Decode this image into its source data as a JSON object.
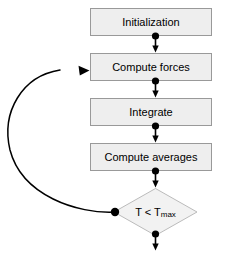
{
  "diagram": {
    "type": "flowchart",
    "canvas": {
      "width": 228,
      "height": 254
    },
    "colors": {
      "node_fill": "#eeeeee",
      "node_stroke": "#999999",
      "connector": "#000000",
      "background": "#ffffff",
      "text": "#000000"
    },
    "nodes": [
      {
        "id": "initialization",
        "shape": "rectangle",
        "label": "Initialization",
        "x": 90,
        "y": 8,
        "width": 122,
        "height": 28
      },
      {
        "id": "compute-forces",
        "shape": "rectangle",
        "label": "Compute forces",
        "x": 90,
        "y": 53,
        "width": 122,
        "height": 28
      },
      {
        "id": "integrate",
        "shape": "rectangle",
        "label": "Integrate",
        "x": 90,
        "y": 98,
        "width": 122,
        "height": 28
      },
      {
        "id": "compute-averages",
        "shape": "rectangle",
        "label": "Compute averages",
        "x": 90,
        "y": 143,
        "width": 122,
        "height": 28
      },
      {
        "id": "condition",
        "shape": "diamond",
        "label_main": "T < T",
        "label_subscript": "max",
        "x": 114,
        "y": 188,
        "width": 83,
        "height": 48
      }
    ],
    "edges": [
      {
        "id": "edge-init-to-forces",
        "from": "initialization",
        "to": "compute-forces",
        "style": "straight-down",
        "has_source_dot": true,
        "has_arrowhead": true
      },
      {
        "id": "edge-forces-to-integrate",
        "from": "compute-forces",
        "to": "integrate",
        "style": "straight-down",
        "has_source_dot": true,
        "has_arrowhead": true
      },
      {
        "id": "edge-integrate-to-averages",
        "from": "integrate",
        "to": "compute-averages",
        "style": "straight-down",
        "has_source_dot": true,
        "has_arrowhead": true
      },
      {
        "id": "edge-averages-to-condition",
        "from": "compute-averages",
        "to": "condition",
        "style": "straight-down",
        "has_source_dot": true,
        "has_arrowhead": true
      },
      {
        "id": "edge-condition-exit",
        "from": "condition",
        "to": null,
        "style": "straight-down",
        "has_source_dot": true,
        "has_arrowhead": true
      },
      {
        "id": "edge-feedback-loop",
        "from": "condition",
        "to": "compute-forces",
        "style": "curved-left-loop",
        "has_source_dot": true,
        "has_arrowhead": true
      }
    ]
  }
}
